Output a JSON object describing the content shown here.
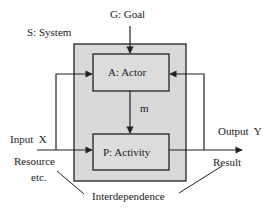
{
  "diagram": {
    "title_goal": "G: Goal",
    "system_label": "S: System",
    "actor_label": "A: Actor",
    "activity_label": "P: Activity",
    "message_label": "m",
    "input_label": "Input  X",
    "output_label": "Output  Y",
    "resource_label_line1": "Resource",
    "resource_label_line2": "etc.",
    "result_label": "Result",
    "interdependence_label": "Interdependence",
    "colors": {
      "system_fill": "#d9d9d9",
      "box_fill": "#dcdcdc",
      "stroke": "#222222",
      "background": "#ffffff"
    }
  },
  "nodes": [
    {
      "id": "system",
      "label": "S: System",
      "type": "container"
    },
    {
      "id": "actor",
      "label": "A: Actor",
      "type": "box"
    },
    {
      "id": "activity",
      "label": "P: Activity",
      "type": "box"
    },
    {
      "id": "goal",
      "label": "G: Goal",
      "type": "external"
    }
  ],
  "edges": [
    {
      "from": "goal",
      "to": "actor"
    },
    {
      "from": "actor",
      "to": "activity",
      "label": "m"
    },
    {
      "from": "input",
      "to": "activity",
      "label": "Input X"
    },
    {
      "from": "input",
      "to": "actor",
      "label": "feedback"
    },
    {
      "from": "activity",
      "to": "output",
      "label": "Output Y"
    },
    {
      "from": "output",
      "to": "actor",
      "label": "feedback"
    }
  ]
}
